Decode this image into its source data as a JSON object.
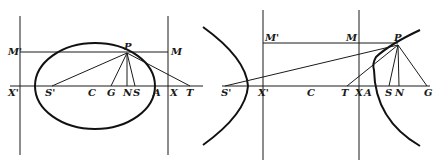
{
  "figures": [
    {
      "name": "ellipse-figure",
      "curve": "ellipse",
      "labels": {
        "P": "P",
        "M_left": "M'",
        "M_right": "M",
        "X_left": "X'",
        "S_prime": "S'",
        "C": "C",
        "G": "G",
        "N": "N",
        "S": "S",
        "A": "A",
        "X_right": "X",
        "T": "T"
      }
    },
    {
      "name": "hyperbola-figure",
      "curve": "hyperbola",
      "labels": {
        "P": "P",
        "M_left": "M'",
        "M_right": "M",
        "S_prime": "S'",
        "X_left": "X'",
        "C": "C",
        "T": "T",
        "X_right": "X",
        "A": "A",
        "S": "S",
        "N": "N",
        "G": "G"
      }
    }
  ],
  "colors": {
    "ink": "#1a1a1a",
    "background": "#ffffff"
  }
}
